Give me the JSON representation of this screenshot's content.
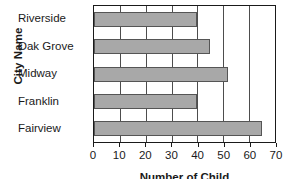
{
  "chart_data": {
    "type": "bar",
    "orientation": "horizontal",
    "title": "",
    "xlabel": "Number of Child",
    "ylabel": "City Name",
    "categories": [
      "Riverside",
      "Oak Grove",
      "Midway",
      "Franklin",
      "Fairview"
    ],
    "values": [
      40,
      45,
      52,
      40,
      65
    ],
    "xlim": [
      0,
      70
    ],
    "xticks": [
      0,
      10,
      20,
      30,
      40,
      50,
      60,
      70
    ],
    "xticklabels": [
      "0",
      "10",
      "20",
      "30",
      "40",
      "50",
      "60",
      "70"
    ],
    "grid": "vertical",
    "legend": "none",
    "bar_color": "#a8a8a8",
    "bar_edge_color": "#555555",
    "axis_color": "#1a1a1a",
    "background": "#ffffff"
  }
}
